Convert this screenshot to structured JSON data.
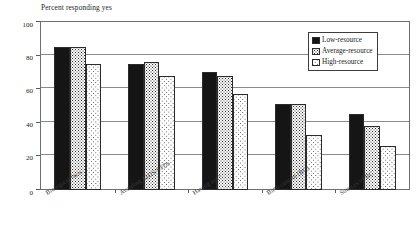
{
  "chart_data": {
    "type": "bar",
    "title": "",
    "ylabel": "Percent responding yes",
    "xlabel": "",
    "ylim": [
      0,
      100
    ],
    "yticks": [
      0,
      20,
      40,
      60,
      80,
      100
    ],
    "grid": true,
    "legend_position": "top-right",
    "categories": [
      "Biological facts",
      "Avoiding AIDS/STDs",
      "Having sex?",
      "Birth control (BC)",
      "Sources of BC"
    ],
    "series": [
      {
        "name": "Low-resource",
        "values": [
          85,
          75,
          70,
          51,
          45
        ]
      },
      {
        "name": "Average-resource",
        "values": [
          85,
          76,
          68,
          51,
          38
        ]
      },
      {
        "name": "High-resource",
        "values": [
          75,
          68,
          57,
          33,
          26
        ]
      }
    ],
    "colors": {
      "low_resource": "#151515",
      "average_resource": "#2a2a2a",
      "high_resource": "#4a4a4a",
      "frame": "#6f6f6f",
      "gridline": "#8a8a8a",
      "background": "#ffffff"
    }
  }
}
